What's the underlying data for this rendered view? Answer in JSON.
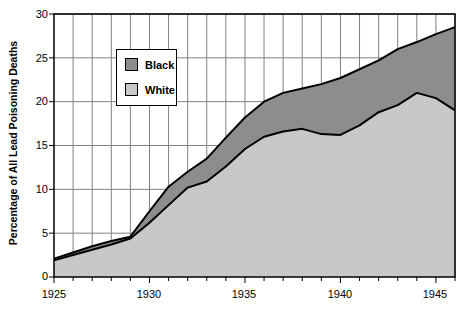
{
  "chart_data": {
    "type": "area",
    "title": "",
    "subtitle": "",
    "xlabel": "",
    "ylabel": "Percentage of All Lead Poisoning Deaths",
    "stacked": true,
    "grid": true,
    "legend_position": "inside-upper-left",
    "xlim": [
      1925,
      1946
    ],
    "ylim": [
      0,
      30
    ],
    "ytick_labels": [
      "0",
      "5",
      "10",
      "15",
      "20",
      "25",
      "30"
    ],
    "ytick_values": [
      0,
      5,
      10,
      15,
      20,
      25,
      30
    ],
    "xtick_labels": [
      "1925",
      "1930",
      "1935",
      "1940",
      "1945"
    ],
    "xtick_values": [
      1925,
      1930,
      1935,
      1940,
      1945
    ],
    "x_minor_ticks_every": 1,
    "x": [
      1925,
      1926,
      1927,
      1928,
      1929,
      1930,
      1931,
      1932,
      1933,
      1934,
      1935,
      1936,
      1937,
      1938,
      1939,
      1940,
      1941,
      1942,
      1943,
      1944,
      1945,
      1946
    ],
    "series": [
      {
        "name": "White",
        "color": "#c8c8c8",
        "values": [
          1.9,
          2.5,
          3.1,
          3.7,
          4.4,
          6.2,
          8.2,
          10.2,
          10.9,
          12.6,
          14.6,
          16.0,
          16.6,
          16.9,
          16.3,
          16.2,
          17.3,
          18.8,
          19.6,
          21.0,
          20.4,
          19.0
        ]
      },
      {
        "name": "Black",
        "color": "#8c8c8c",
        "values": [
          0.2,
          0.3,
          0.4,
          0.4,
          0.2,
          1.3,
          2.1,
          1.8,
          2.6,
          3.3,
          3.6,
          4.0,
          4.4,
          4.6,
          5.7,
          6.5,
          6.4,
          5.9,
          6.4,
          5.8,
          7.3,
          9.5
        ]
      }
    ],
    "cumulative_total": [
      2.1,
      2.8,
      3.5,
      4.1,
      4.6,
      7.5,
      10.3,
      12.0,
      13.5,
      15.9,
      18.2,
      20.0,
      21.0,
      21.5,
      22.0,
      22.7,
      23.7,
      24.7,
      26.0,
      26.8,
      27.7,
      28.5
    ],
    "legend": [
      {
        "label": "Black",
        "color": "#8c8c8c"
      },
      {
        "label": "White",
        "color": "#c8c8c8"
      }
    ]
  },
  "legend": {
    "items": [
      {
        "label": "Black"
      },
      {
        "label": "White"
      }
    ]
  },
  "axes": {
    "y_title": "Percentage of All Lead Poisoning Deaths",
    "y_labels": [
      "30",
      "25",
      "20",
      "15",
      "10",
      "5",
      "0"
    ],
    "x_labels": [
      "1925",
      "1930",
      "1935",
      "1940",
      "1945"
    ]
  },
  "colors": {
    "black_series": "#8c8c8c",
    "white_series": "#c8c8c8",
    "grid": "#808080",
    "axis": "#000000",
    "plot_background": "#ffffff"
  }
}
